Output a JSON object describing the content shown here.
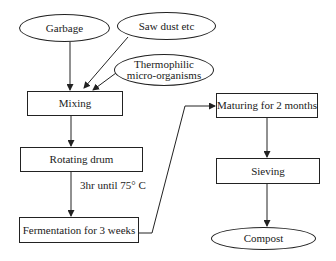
{
  "diagram": {
    "type": "flowchart",
    "nodes": {
      "garbage": {
        "label": "Garbage",
        "shape": "ellipse"
      },
      "sawdust": {
        "label": "Saw dust etc",
        "shape": "ellipse"
      },
      "thermophilic": {
        "label_line1": "Thermophilic",
        "label_line2": "micro-organisms",
        "shape": "ellipse"
      },
      "mixing": {
        "label": "Mixing",
        "shape": "rect"
      },
      "rotating_drum": {
        "label": "Rotating drum",
        "shape": "rect"
      },
      "fermentation": {
        "label": "Fermentation for 3 weeks",
        "shape": "rect"
      },
      "maturing": {
        "label": "Maturing for 2 months",
        "shape": "rect"
      },
      "sieving": {
        "label": "Sieving",
        "shape": "rect"
      },
      "compost": {
        "label": "Compost",
        "shape": "ellipse"
      }
    },
    "edge_labels": {
      "drum_to_fermentation": "3hr until 75° C"
    },
    "edges": [
      {
        "from": "garbage",
        "to": "mixing"
      },
      {
        "from": "sawdust",
        "to": "mixing"
      },
      {
        "from": "thermophilic",
        "to": "mixing"
      },
      {
        "from": "mixing",
        "to": "rotating_drum"
      },
      {
        "from": "rotating_drum",
        "to": "fermentation",
        "label": "3hr until 75° C"
      },
      {
        "from": "fermentation",
        "to": "maturing"
      },
      {
        "from": "maturing",
        "to": "sieving"
      },
      {
        "from": "sieving",
        "to": "compost"
      }
    ]
  }
}
